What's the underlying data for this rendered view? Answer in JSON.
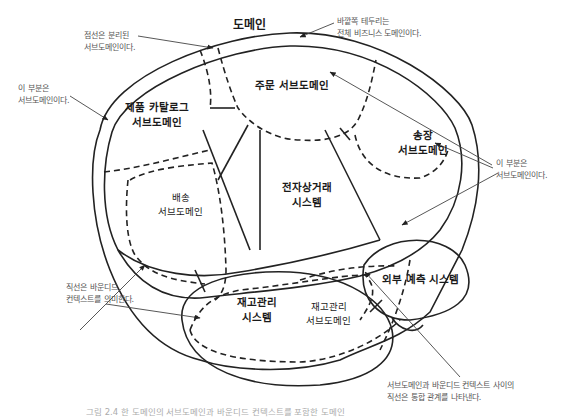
{
  "diagram": {
    "title": "도메인",
    "regions": {
      "product_catalog": "제품 카탈로그\n서브도메인",
      "order": "주문 서브도메인",
      "invoice": "송장\n서브도메인",
      "shipping": "배송\n서브도메인",
      "ecommerce_system": "전자상거래\n시스템",
      "external_forecast_system": "외부 예측 시스템",
      "inventory_system": "재고관리\n시스템",
      "inventory_subdomain": "재고관리\n서브도메인"
    },
    "annotations": {
      "dashed_lines": "점선은 분리된\n서브도메인이다.",
      "outer_border": "바깥쪽 테두리는\n전체 비즈니스 도메인이다.",
      "left_subdomain": "이 부분은\n서브도메인이다.",
      "right_subdomain": "이 부분은\n서브도메인이다.",
      "solid_lines": "직선은 바운디드\n컨텍스트를 의미한다.",
      "integration": "서브도메인과 바운디드 컨텍스트 사이의\n직선은 통합 관계를 나타낸다."
    },
    "caption": "그림 2.4 한 도메인의 서브도메인과 바운디드 컨텍스트를 포함한 도메인"
  }
}
